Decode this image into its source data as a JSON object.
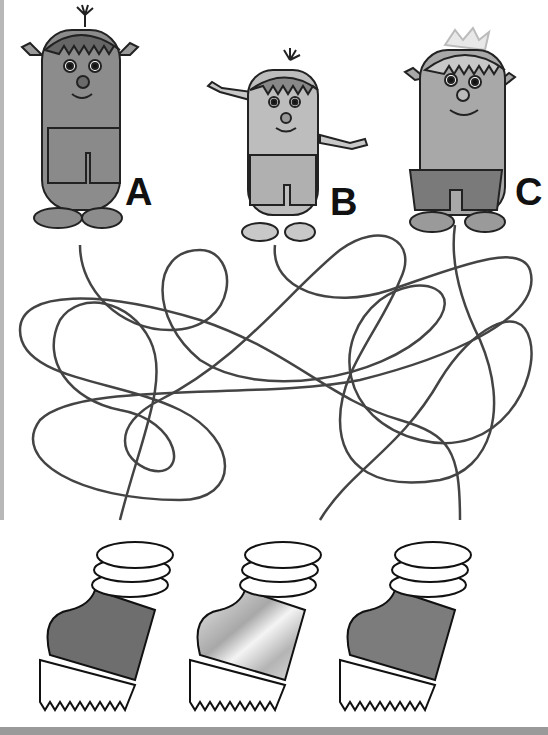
{
  "puzzle": {
    "characters": [
      {
        "id": "A",
        "label": "A",
        "shade": "#8c8c8c"
      },
      {
        "id": "B",
        "label": "B",
        "shade": "#bdbdbd"
      },
      {
        "id": "C",
        "label": "C",
        "shade": "#a8a8a8"
      }
    ],
    "boots": [
      {
        "id": "boot-1",
        "fill": "#6e6e6e"
      },
      {
        "id": "boot-2",
        "fill": "#d0d0d0"
      },
      {
        "id": "boot-3",
        "fill": "#7c7c7c"
      }
    ],
    "line_color": "#444444"
  }
}
